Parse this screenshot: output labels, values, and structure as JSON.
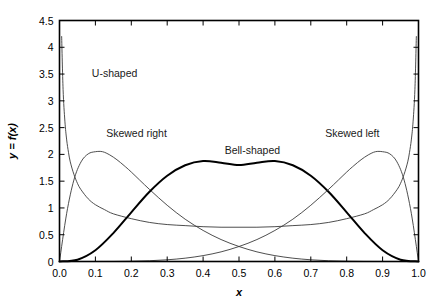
{
  "chart_data": {
    "type": "line",
    "title": "",
    "xlabel": "x",
    "ylabel": "y = f(x)",
    "xlim": [
      0.0,
      1.0
    ],
    "ylim": [
      0.0,
      4.5
    ],
    "grid": false,
    "legend": "inline-annotations",
    "xticks": [
      "0.0",
      "0.1",
      "0.2",
      "0.3",
      "0.4",
      "0.5",
      "0.6",
      "0.7",
      "0.8",
      "0.9",
      "1.0"
    ],
    "xtick_values": [
      0.0,
      0.1,
      0.2,
      0.3,
      0.4,
      0.5,
      0.6,
      0.7,
      0.8,
      0.9,
      1.0
    ],
    "yticks": [
      "0",
      "0.5",
      "1",
      "1.5",
      "2",
      "2.5",
      "3",
      "3.5",
      "4",
      "4.5"
    ],
    "ytick_values": [
      0,
      0.5,
      1,
      1.5,
      2,
      2.5,
      3,
      3.5,
      4,
      4.5
    ],
    "annotations": [
      {
        "text": "U-shaped",
        "x": 0.09,
        "y": 3.45
      },
      {
        "text": "Skewed right",
        "x": 0.13,
        "y": 2.32
      },
      {
        "text": "Bell-shaped",
        "x": 0.46,
        "y": 2.0
      },
      {
        "text": "Skewed left",
        "x": 0.74,
        "y": 2.32
      }
    ],
    "series": [
      {
        "name": "U-shaped",
        "label": "U-shaped",
        "color": "#3a3a3a",
        "linewidth": 0.9,
        "distribution": "Beta(0.5, 0.5)",
        "x": [
          0.006,
          0.01,
          0.015,
          0.02,
          0.025,
          0.03,
          0.04,
          0.05,
          0.06,
          0.08,
          0.1,
          0.125,
          0.15,
          0.2,
          0.25,
          0.3,
          0.35,
          0.4,
          0.45,
          0.5,
          0.55,
          0.6,
          0.65,
          0.7,
          0.75,
          0.8,
          0.85,
          0.875,
          0.9,
          0.92,
          0.94,
          0.95,
          0.96,
          0.97,
          0.975,
          0.98,
          0.985,
          0.99,
          0.994
        ],
        "y": [
          4.2,
          3.21,
          2.62,
          2.27,
          2.04,
          1.86,
          1.63,
          1.46,
          1.34,
          1.17,
          1.06,
          0.97,
          0.89,
          0.8,
          0.73,
          0.69,
          0.67,
          0.65,
          0.64,
          0.64,
          0.64,
          0.65,
          0.67,
          0.69,
          0.73,
          0.8,
          0.89,
          0.97,
          1.06,
          1.17,
          1.34,
          1.46,
          1.63,
          1.86,
          2.04,
          2.27,
          2.62,
          3.21,
          4.2
        ]
      },
      {
        "name": "Skewed right",
        "label": "Skewed right",
        "color": "#3a3a3a",
        "linewidth": 0.9,
        "distribution": "Beta(2, 8)",
        "x": [
          0.0,
          0.02,
          0.04,
          0.06,
          0.08,
          0.1,
          0.12,
          0.14,
          0.16,
          0.18,
          0.2,
          0.25,
          0.3,
          0.35,
          0.4,
          0.45,
          0.5,
          0.55,
          0.6,
          0.65,
          0.7,
          0.75,
          0.8,
          0.85,
          0.9,
          0.95,
          1.0
        ],
        "y": [
          0.0,
          0.9,
          1.52,
          1.86,
          2.01,
          2.05,
          2.05,
          1.99,
          1.9,
          1.79,
          1.67,
          1.35,
          1.05,
          0.79,
          0.58,
          0.41,
          0.28,
          0.18,
          0.11,
          0.062,
          0.032,
          0.014,
          0.005,
          0.0012,
          0.0002,
          0.0,
          0.0
        ]
      },
      {
        "name": "Bell-shaped",
        "label": "Bell-shaped",
        "color": "#000000",
        "linewidth": 2.0,
        "distribution": "Beta(5, 5)",
        "x": [
          0.0,
          0.05,
          0.1,
          0.15,
          0.2,
          0.25,
          0.3,
          0.35,
          0.4,
          0.45,
          0.5,
          0.55,
          0.6,
          0.65,
          0.7,
          0.75,
          0.8,
          0.85,
          0.9,
          0.95,
          1.0
        ],
        "y": [
          0.0,
          0.034,
          0.21,
          0.53,
          0.918,
          1.297,
          1.601,
          1.797,
          1.876,
          1.845,
          1.8,
          1.845,
          1.876,
          1.797,
          1.601,
          1.297,
          0.918,
          0.53,
          0.21,
          0.034,
          0.0
        ]
      },
      {
        "name": "Skewed left",
        "label": "Skewed left",
        "color": "#3a3a3a",
        "linewidth": 0.9,
        "distribution": "Beta(8, 2)",
        "x": [
          0.0,
          0.05,
          0.1,
          0.15,
          0.2,
          0.25,
          0.3,
          0.35,
          0.4,
          0.45,
          0.5,
          0.55,
          0.6,
          0.65,
          0.7,
          0.75,
          0.8,
          0.82,
          0.84,
          0.86,
          0.88,
          0.9,
          0.92,
          0.94,
          0.96,
          0.98,
          1.0
        ],
        "y": [
          0.0,
          0.0,
          0.0002,
          0.0012,
          0.005,
          0.014,
          0.032,
          0.062,
          0.11,
          0.18,
          0.28,
          0.41,
          0.58,
          0.79,
          1.05,
          1.35,
          1.67,
          1.79,
          1.9,
          1.99,
          2.05,
          2.05,
          2.01,
          1.86,
          1.52,
          0.9,
          0.0
        ]
      }
    ]
  },
  "axes": {
    "frame_color": "#000000",
    "background": "#ffffff"
  }
}
